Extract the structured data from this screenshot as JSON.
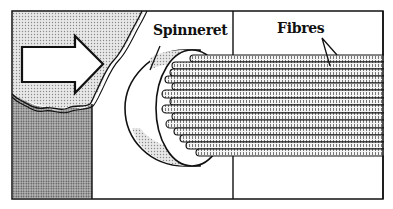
{
  "diagram": {
    "labels": {
      "spinneret": "Spinneret",
      "fibres": "Fibres"
    },
    "elements": [
      {
        "name": "flow-arrow",
        "description": "Large white arrow pointing right indicating flow of molten polymer"
      },
      {
        "name": "spinneret",
        "description": "Cylindrical disc with holes"
      },
      {
        "name": "fibres",
        "description": "Bundle of parallel extruded fibres",
        "count": 13
      }
    ],
    "colors": {
      "line": "#111111",
      "light_stipple": "#d6d6d6",
      "dark_stipple": "#a8a8a8",
      "background": "#ffffff"
    }
  }
}
